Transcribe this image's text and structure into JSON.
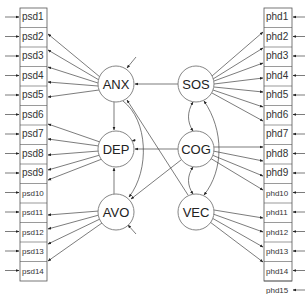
{
  "diagram": {
    "type": "structural-equation-model path diagram",
    "left_indicators": {
      "labels": [
        "psd1",
        "psd2",
        "psd3",
        "psd4",
        "psd5",
        "psd6",
        "psd7",
        "psd8",
        "psd9",
        "psd10",
        "psd11",
        "psd12",
        "psd13",
        "psd14"
      ]
    },
    "right_indicators": {
      "labels": [
        "phd1",
        "phd2",
        "phd3",
        "phd4",
        "phd5",
        "phd6",
        "phd7",
        "phd8",
        "phd9",
        "phd10",
        "phd11",
        "phd12",
        "phd13",
        "phd14",
        "phd15"
      ]
    },
    "latent": {
      "anx": "ANX",
      "dep": "DEP",
      "avo": "AVO",
      "sos": "SOS",
      "cog": "COG",
      "vec": "VEC"
    },
    "edges": [
      {
        "from": "SOS",
        "to": "ANX"
      },
      {
        "from": "COG",
        "to": "DEP"
      },
      {
        "from": "ANX",
        "to": "DEP"
      },
      {
        "from": "AVO",
        "to": "DEP"
      },
      {
        "from": "COG",
        "to": "AVO"
      },
      {
        "from": "ANX",
        "to": "AVO"
      },
      {
        "from": "VEC",
        "to": "ANX"
      },
      {
        "from": "SOS",
        "to": "COG",
        "bidirectional": true
      },
      {
        "from": "COG",
        "to": "VEC",
        "bidirectional": true
      },
      {
        "from": "SOS",
        "to": "VEC",
        "bidirectional": true
      }
    ]
  }
}
